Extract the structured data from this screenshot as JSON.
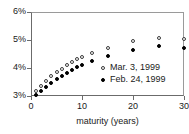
{
  "chart_data": {
    "type": "scatter",
    "title": "",
    "xlabel": "maturity (years)",
    "ylabel": "",
    "xlim": [
      0,
      30
    ],
    "ylim": [
      3,
      6
    ],
    "xticks": [
      0,
      10,
      20,
      30
    ],
    "xtick_labels": [
      "0",
      "10",
      "20",
      "30"
    ],
    "yticks": [
      3,
      4,
      5,
      6
    ],
    "ytick_labels": [
      "3%",
      "4%",
      "5%",
      "6%"
    ],
    "grid": false,
    "legend_position": "center-right",
    "x": [
      1,
      2,
      3,
      4,
      5,
      6,
      7,
      8,
      9,
      10,
      12,
      15,
      20,
      25,
      30
    ],
    "series": [
      {
        "name": "Mar. 3, 1999",
        "marker": "open-circle",
        "color": "#3a3a3a",
        "values": [
          3.18,
          3.35,
          3.55,
          3.72,
          3.86,
          3.98,
          4.1,
          4.22,
          4.32,
          4.4,
          4.52,
          4.73,
          4.95,
          5.08,
          5.02
        ]
      },
      {
        "name": "Feb. 24, 1999",
        "marker": "filled-circle",
        "color": "#000000",
        "values": [
          3.05,
          3.18,
          3.33,
          3.48,
          3.6,
          3.72,
          3.83,
          3.94,
          4.03,
          4.1,
          4.24,
          4.44,
          4.66,
          4.8,
          4.72
        ]
      }
    ]
  },
  "legend": {
    "items": [
      {
        "label": "Mar. 3, 1999",
        "marker": "open-circle"
      },
      {
        "label": "Feb. 24, 1999",
        "marker": "filled-circle"
      }
    ]
  }
}
